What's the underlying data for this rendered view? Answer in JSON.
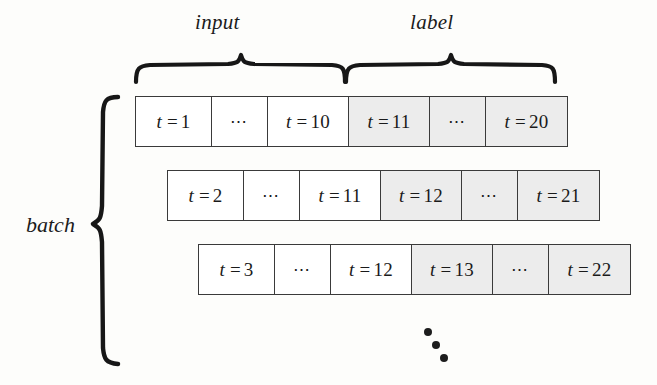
{
  "figure": {
    "title_braces": {
      "input_label": "input",
      "label_label": "label"
    },
    "batch_label": "batch",
    "continuation_marker": "vertical-dots",
    "colors": {
      "input_cell_bg": "#ffffff",
      "label_cell_bg": "#ececec",
      "cell_border": "#3a3a3a",
      "text": "#1a1a1a",
      "page_bg": "#fdfdfb"
    }
  },
  "rows": [
    {
      "cells": [
        {
          "text": "t = 1",
          "kind": "input",
          "size": "tick"
        },
        {
          "text": "⋯",
          "kind": "input",
          "size": "dots"
        },
        {
          "text": "t = 10",
          "kind": "input",
          "size": "wide"
        },
        {
          "text": "t = 11",
          "kind": "label",
          "size": "wide"
        },
        {
          "text": "⋯",
          "kind": "label",
          "size": "dots"
        },
        {
          "text": "t = 20",
          "kind": "label",
          "size": "wide"
        }
      ]
    },
    {
      "cells": [
        {
          "text": "t = 2",
          "kind": "input",
          "size": "tick"
        },
        {
          "text": "⋯",
          "kind": "input",
          "size": "dots"
        },
        {
          "text": "t = 11",
          "kind": "input",
          "size": "wide"
        },
        {
          "text": "t = 12",
          "kind": "label",
          "size": "wide"
        },
        {
          "text": "⋯",
          "kind": "label",
          "size": "dots"
        },
        {
          "text": "t = 21",
          "kind": "label",
          "size": "wide"
        }
      ]
    },
    {
      "cells": [
        {
          "text": "t = 3",
          "kind": "input",
          "size": "tick"
        },
        {
          "text": "⋯",
          "kind": "input",
          "size": "dots"
        },
        {
          "text": "t = 12",
          "kind": "input",
          "size": "wide"
        },
        {
          "text": "t = 13",
          "kind": "label",
          "size": "wide"
        },
        {
          "text": "⋯",
          "kind": "label",
          "size": "dots"
        },
        {
          "text": "t = 22",
          "kind": "label",
          "size": "wide"
        }
      ]
    }
  ]
}
